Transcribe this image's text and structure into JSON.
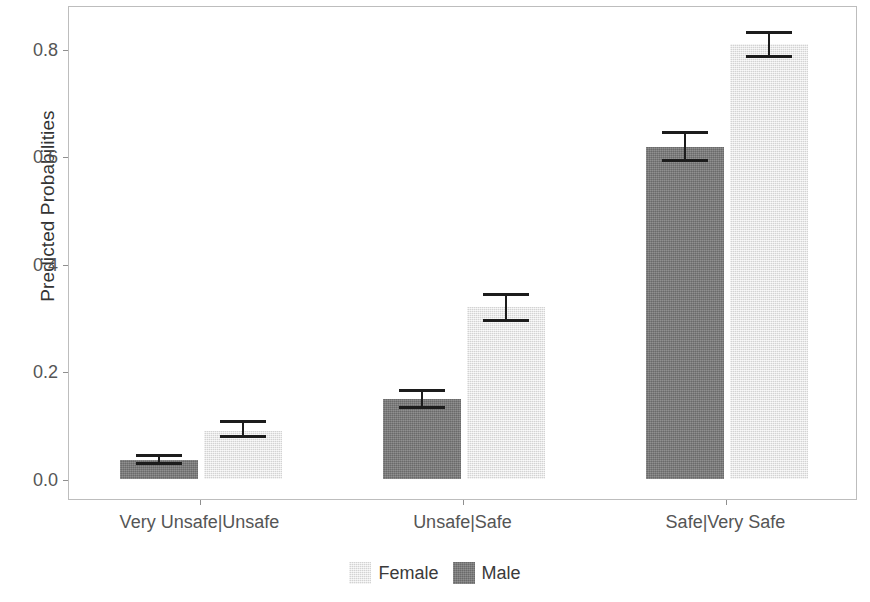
{
  "chart_data": {
    "type": "bar",
    "title": "",
    "xlabel": "",
    "ylabel": "Predicted Probabilities",
    "categories": [
      "Very Unsafe|Unsafe",
      "Unsafe|Safe",
      "Safe|Very Safe"
    ],
    "ylim": [
      0.0,
      0.87
    ],
    "y_ticks": [
      0.0,
      0.2,
      0.4,
      0.6,
      0.8
    ],
    "y_tick_labels": [
      "0.0",
      "0.2",
      "0.4",
      "0.6",
      "0.8"
    ],
    "grid": false,
    "legend_position": "bottom",
    "legend_entries": [
      "Female",
      "Male"
    ],
    "bar_order_within_group": [
      "Male",
      "Female"
    ],
    "series": [
      {
        "name": "Male",
        "color": "#777777",
        "values": [
          0.036,
          0.149,
          0.618
        ],
        "error_low": [
          0.026,
          0.131,
          0.589
        ],
        "error_high": [
          0.046,
          0.167,
          0.647
        ]
      },
      {
        "name": "Female",
        "color": "#e6e6e6",
        "values": [
          0.09,
          0.32,
          0.809
        ],
        "error_low": [
          0.077,
          0.291,
          0.783
        ],
        "error_high": [
          0.11,
          0.345,
          0.832
        ]
      }
    ]
  },
  "axis": {
    "y_title": "Predicted Probabilities"
  },
  "legend": {
    "items": [
      {
        "label": "Female",
        "key": "female"
      },
      {
        "label": "Male",
        "key": "male"
      }
    ]
  }
}
